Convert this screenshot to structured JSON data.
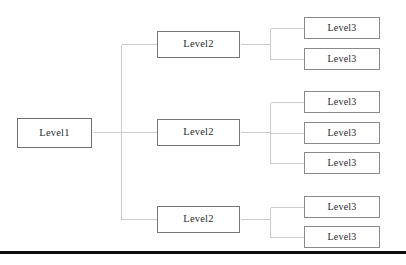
{
  "diagram": {
    "background_color": "#ffffff",
    "edge_color": "#cccccc",
    "node_border_color": "#7a7a7a",
    "node_fill_color": "#ffffff",
    "text_color": "#2b2b2b",
    "baseline_rule": {
      "color": "#0d0d0d",
      "x": 0,
      "y": 251,
      "width": 406,
      "height": 3
    },
    "nodes": [
      {
        "id": "l1",
        "label": "Level1",
        "level": 1,
        "x": 17,
        "y": 118,
        "width": 75,
        "height": 30
      },
      {
        "id": "l2a",
        "label": "Level2",
        "level": 2,
        "x": 157,
        "y": 31,
        "width": 83,
        "height": 27
      },
      {
        "id": "l2b",
        "label": "Level2",
        "level": 2,
        "x": 157,
        "y": 119,
        "width": 83,
        "height": 27
      },
      {
        "id": "l2c",
        "label": "Level2",
        "level": 2,
        "x": 157,
        "y": 206,
        "width": 83,
        "height": 27
      },
      {
        "id": "l3a1",
        "label": "Level3",
        "level": 3,
        "x": 304,
        "y": 17,
        "width": 76,
        "height": 22
      },
      {
        "id": "l3a2",
        "label": "Level3",
        "level": 3,
        "x": 304,
        "y": 48,
        "width": 76,
        "height": 22
      },
      {
        "id": "l3b1",
        "label": "Level3",
        "level": 3,
        "x": 304,
        "y": 91,
        "width": 76,
        "height": 22
      },
      {
        "id": "l3b2",
        "label": "Level3",
        "level": 3,
        "x": 304,
        "y": 122,
        "width": 76,
        "height": 22
      },
      {
        "id": "l3b3",
        "label": "Level3",
        "level": 3,
        "x": 304,
        "y": 152,
        "width": 76,
        "height": 22
      },
      {
        "id": "l3c1",
        "label": "Level3",
        "level": 3,
        "x": 304,
        "y": 196,
        "width": 76,
        "height": 22
      },
      {
        "id": "l3c2",
        "label": "Level3",
        "level": 3,
        "x": 304,
        "y": 226,
        "width": 76,
        "height": 22
      }
    ],
    "edges": {
      "description": "Orthogonal elbow connectors from parent right edge to child left edge",
      "trunk": {
        "x": 121,
        "y_top": 44,
        "y_bottom": 219
      },
      "stub_from_root": {
        "x_start": 92,
        "x_end": 157,
        "y": 132
      },
      "branch_y": [
        44,
        132,
        219
      ],
      "group_spines": [
        {
          "parent": "l2a",
          "x": 270,
          "y_top": 28,
          "y_bottom": 59,
          "y_in": 44
        },
        {
          "parent": "l2b",
          "x": 270,
          "y_top": 102,
          "y_bottom": 163,
          "y_in": 132
        },
        {
          "parent": "l2c",
          "x": 270,
          "y_top": 207,
          "y_bottom": 237,
          "y_in": 219
        }
      ],
      "child_stubs": [
        {
          "from_x": 270,
          "to_x": 304,
          "y": 28
        },
        {
          "from_x": 270,
          "to_x": 304,
          "y": 59
        },
        {
          "from_x": 270,
          "to_x": 304,
          "y": 102
        },
        {
          "from_x": 270,
          "to_x": 304,
          "y": 133
        },
        {
          "from_x": 270,
          "to_x": 304,
          "y": 163
        },
        {
          "from_x": 270,
          "to_x": 304,
          "y": 207
        },
        {
          "from_x": 270,
          "to_x": 304,
          "y": 237
        }
      ],
      "parent_stubs": [
        {
          "from_x": 240,
          "to_x": 270,
          "y": 44
        },
        {
          "from_x": 240,
          "to_x": 270,
          "y": 132
        },
        {
          "from_x": 240,
          "to_x": 270,
          "y": 219
        }
      ],
      "trunk_to_parent": [
        {
          "from_x": 121,
          "to_x": 157,
          "y": 44
        },
        {
          "from_x": 121,
          "to_x": 157,
          "y": 132
        },
        {
          "from_x": 121,
          "to_x": 157,
          "y": 219
        }
      ]
    }
  }
}
